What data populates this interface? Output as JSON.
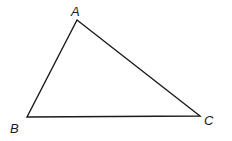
{
  "diagram": {
    "type": "triangle",
    "vertices": [
      {
        "id": "A",
        "label": "A",
        "x": 77,
        "y": 20,
        "label_x": 71,
        "label_y": 16
      },
      {
        "id": "B",
        "label": "B",
        "x": 27,
        "y": 117,
        "label_x": 10,
        "label_y": 133
      },
      {
        "id": "C",
        "label": "C",
        "x": 200,
        "y": 116,
        "label_x": 204,
        "label_y": 125
      }
    ],
    "edges": [
      [
        "A",
        "B"
      ],
      [
        "B",
        "C"
      ],
      [
        "C",
        "A"
      ]
    ],
    "stroke_color": "#1a1a1a",
    "background": "#ffffff"
  }
}
